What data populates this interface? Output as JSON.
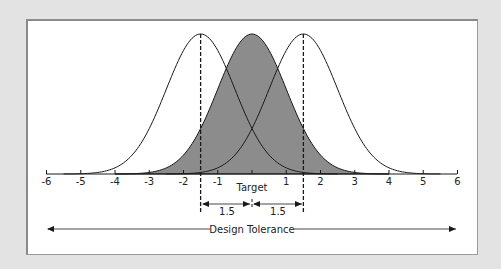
{
  "diagram": {
    "title": "",
    "colors": {
      "background": "#e3e3e3",
      "panel": "#ffffff",
      "fill": "#8c8c8c",
      "stroke": "#1a1a1a"
    },
    "axis": {
      "ticks": [
        "-6",
        "-5",
        "-4",
        "-3",
        "-2",
        "-1",
        "0",
        "1",
        "2",
        "3",
        "4",
        "5",
        "6"
      ],
      "visible_tick_labels": [
        "-6",
        "-5",
        "-4",
        "-3",
        "-2",
        "-1",
        "1",
        "2",
        "3",
        "4",
        "5",
        "6"
      ],
      "target_label": "Target"
    },
    "curves": [
      {
        "name": "shifted-left",
        "mean": -1.5,
        "sigma": 1,
        "filled": false
      },
      {
        "name": "centered",
        "mean": 0,
        "sigma": 1,
        "filled": true
      },
      {
        "name": "shifted-right",
        "mean": 1.5,
        "sigma": 1,
        "filled": false
      }
    ],
    "shift_markers": [
      {
        "position": -1.5,
        "style": "dashed"
      },
      {
        "position": 1.5,
        "style": "dashed"
      }
    ],
    "dimensions": {
      "left_shift_label": "1.5",
      "right_shift_label": "1.5"
    },
    "tolerance": {
      "label": "Design Tolerance",
      "from": -6,
      "to": 6
    }
  }
}
